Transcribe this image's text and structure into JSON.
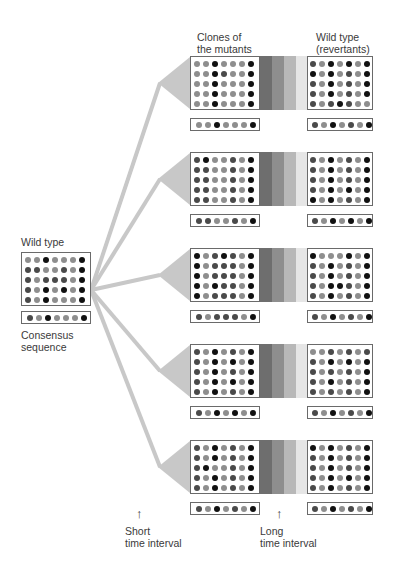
{
  "labels": {
    "wild_type": "Wild type",
    "consensus": "Consensus\nsequence",
    "clones_header": "Clones of\nthe mutants",
    "revertants_header": "Wild type\n(revertants)",
    "short_interval": "Short\ntime interval",
    "long_interval": "Long\ntime interval"
  },
  "colors": {
    "dark": "#111111",
    "mid": "#4a4a4a",
    "light": "#8e8e8e",
    "connector": "#c8c8c8",
    "bands": [
      "#6e6e6e",
      "#8e8e8e",
      "#b8b8b8",
      "#e6e6e6"
    ]
  },
  "wild_type": {
    "grid": [
      "LLDLLLD",
      "MMLLMLD",
      "MLMMMLD",
      "MLDLDLD",
      "MLDLLLD"
    ],
    "consensus": "MLDLLLD"
  },
  "rows": [
    {
      "mutant_grid": [
        "LLDLLLD",
        "LLDMLLD",
        "LLDLLLD",
        "LLDLLLD",
        "LLDLLLD"
      ],
      "mutant_consensus": "LLDLLLD",
      "revertant_grid": [
        "MLDLDLD",
        "DLDLMLD",
        "MLDLMLD",
        "MLDLMLD",
        "MLMDMLL"
      ],
      "revertant_consensus": "MLDLMLD"
    },
    {
      "mutant_grid": [
        "MDLLMLD",
        "MMLLMLD",
        "MMLLMLD",
        "MMLLMLD",
        "MMLLMLD"
      ],
      "mutant_consensus": "MMLLMLD",
      "revertant_grid": [
        "MLDLMLD",
        "MLDLMLD",
        "MLDLMLD",
        "MLDLDLD",
        "DLDLMLD"
      ],
      "revertant_consensus": "MLDLDLD"
    },
    {
      "mutant_grid": [
        "DLMDMLD",
        "DLMMMLD",
        "DLMMMLD",
        "DLDMMLD",
        "DLMMMLD"
      ],
      "mutant_consensus": "MLMMMLD",
      "revertant_grid": [
        "DLLLDLD",
        "MLDLMLD",
        "MLDLMLD",
        "MLDDMLD",
        "MLDLMLD"
      ],
      "revertant_consensus": "MLDLMLD"
    },
    {
      "mutant_grid": [
        "MLDLMLD",
        "MLDLDLD",
        "MLDLMLD",
        "MLDLDLD",
        "MLDLMLD"
      ],
      "mutant_consensus": "MLDLDLD",
      "revertant_grid": [
        "LLMLMLM",
        "MLDLDLD",
        "MLMLMLD",
        "MLDLMLD",
        "MLMLMLD"
      ],
      "revertant_consensus": "MLDLMLD"
    },
    {
      "mutant_grid": [
        "MLDLMLD",
        "MLDLMLD",
        "MDLLMLD",
        "MLDLMLD",
        "MLDLMLD"
      ],
      "mutant_consensus": "MLDLMLD",
      "revertant_grid": [
        "DLDLMLD",
        "MLDLMLD",
        "MLDLMLD",
        "MLDLDLD",
        "MLDLMLD"
      ],
      "revertant_consensus": "MLDLMLD"
    }
  ]
}
